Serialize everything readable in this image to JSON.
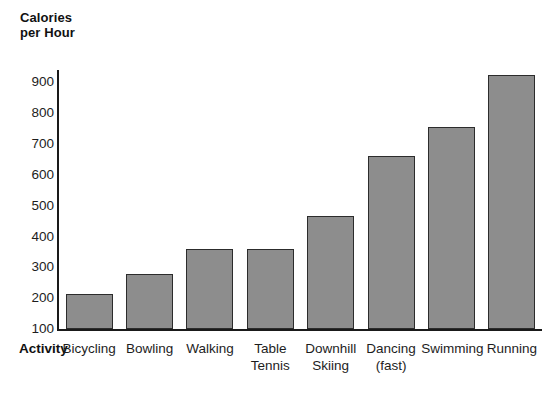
{
  "chart_data": {
    "type": "bar",
    "title": "Calories\nper Hour",
    "xlabel": "Activity",
    "ylabel": "Calories per Hour",
    "categories": [
      "Bicycling",
      "Bowling",
      "Walking",
      "Table\nTennis",
      "Downhill\nSkiing",
      "Dancing\n(fast)",
      "Swimming",
      "Running"
    ],
    "values": [
      215,
      280,
      360,
      360,
      465,
      660,
      755,
      925
    ],
    "ylim": [
      100,
      940
    ],
    "yticks": [
      100,
      200,
      300,
      400,
      500,
      600,
      700,
      800,
      900
    ],
    "ytick_labels": [
      "100",
      "200",
      "300",
      "400",
      "500",
      "600",
      "700",
      "800",
      "900"
    ],
    "grid": false,
    "legend": null,
    "bar_color": "#8d8d8d",
    "bar_edge_color": "#2c2c2c",
    "axis_color": "#1a1a1a",
    "background": "#ffffff"
  }
}
